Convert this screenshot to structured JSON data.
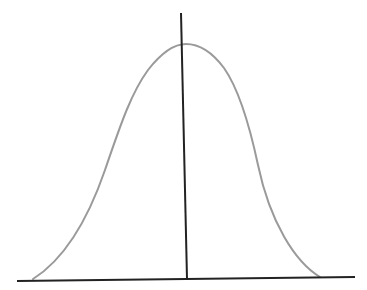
{
  "diagram": {
    "type": "normal-distribution-bell-curve",
    "background": "#ffffff",
    "curve_color": "#9a9a9a",
    "axis_color": "#222222",
    "labels": []
  }
}
